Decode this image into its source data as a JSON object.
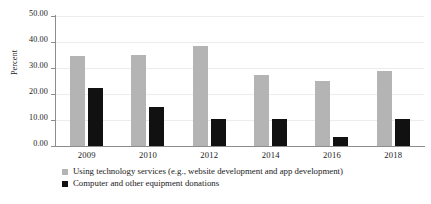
{
  "chart_data": {
    "type": "bar",
    "title": "",
    "subtitle": "",
    "xlabel": "",
    "ylabel": "Percent",
    "ylim": [
      0,
      50
    ],
    "yticks": [
      "0.00",
      "10.00",
      "20.00",
      "30.00",
      "40.00",
      "50.00"
    ],
    "ytick_values": [
      0,
      10,
      20,
      30,
      40,
      50
    ],
    "grid": "horizontal",
    "legend_position": "bottom-left",
    "categories": [
      "2009",
      "2010",
      "2012",
      "2014",
      "2016",
      "2018"
    ],
    "series": [
      {
        "name": "Using technology services (e.g., website development and app development)",
        "color": "#b4b4b4",
        "values": [
          34.5,
          35.0,
          38.5,
          27.5,
          25.0,
          29.0
        ]
      },
      {
        "name": "Computer and other equipment donations",
        "color": "#111111",
        "values": [
          22.5,
          15.0,
          10.5,
          10.5,
          3.5,
          10.5
        ]
      }
    ]
  }
}
